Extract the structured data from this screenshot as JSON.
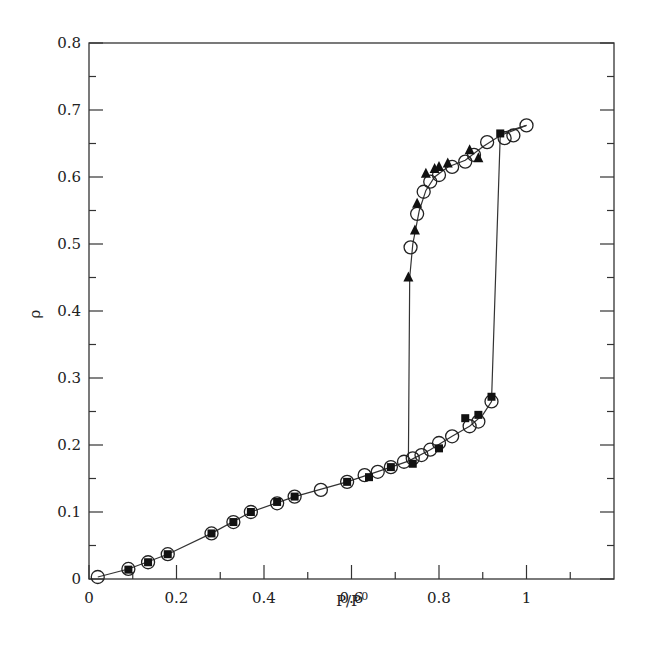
{
  "chart_data": {
    "type": "scatter",
    "title": "",
    "xlabel": "P/P⁰",
    "ylabel": "ρ",
    "xlim": [
      0,
      1.2
    ],
    "ylim": [
      0,
      0.8
    ],
    "grid": false,
    "legend": null,
    "x_ticks": [
      0,
      0.2,
      0.4,
      0.6,
      0.8,
      1
    ],
    "x_tick_labels": [
      "0",
      "0.2",
      "0.4",
      "0.6",
      "0.8",
      "1"
    ],
    "y_ticks": [
      0,
      0.1,
      0.2,
      0.3,
      0.4,
      0.5,
      0.6,
      0.7,
      0.8
    ],
    "y_tick_labels": [
      "0",
      "0.1",
      "0.2",
      "0.3",
      "0.4",
      "0.5",
      "0.6",
      "0.7",
      "0.8"
    ],
    "series": [
      {
        "name": "open-circles",
        "marker": "circle-open",
        "points": [
          [
            0.02,
            0.003
          ],
          [
            0.09,
            0.015
          ],
          [
            0.135,
            0.025
          ],
          [
            0.18,
            0.037
          ],
          [
            0.28,
            0.068
          ],
          [
            0.33,
            0.085
          ],
          [
            0.37,
            0.1
          ],
          [
            0.43,
            0.113
          ],
          [
            0.47,
            0.123
          ],
          [
            0.53,
            0.133
          ],
          [
            0.59,
            0.145
          ],
          [
            0.63,
            0.155
          ],
          [
            0.66,
            0.16
          ],
          [
            0.69,
            0.167
          ],
          [
            0.72,
            0.175
          ],
          [
            0.74,
            0.18
          ],
          [
            0.76,
            0.185
          ],
          [
            0.78,
            0.193
          ],
          [
            0.8,
            0.203
          ],
          [
            0.83,
            0.213
          ],
          [
            0.87,
            0.228
          ],
          [
            0.89,
            0.235
          ],
          [
            0.92,
            0.265
          ],
          [
            0.735,
            0.495
          ],
          [
            0.75,
            0.545
          ],
          [
            0.765,
            0.578
          ],
          [
            0.78,
            0.593
          ],
          [
            0.8,
            0.603
          ],
          [
            0.83,
            0.615
          ],
          [
            0.86,
            0.623
          ],
          [
            0.88,
            0.633
          ],
          [
            0.91,
            0.652
          ],
          [
            0.95,
            0.658
          ],
          [
            0.97,
            0.662
          ],
          [
            1.0,
            0.677
          ]
        ]
      },
      {
        "name": "filled-squares",
        "marker": "square-filled",
        "points": [
          [
            0.09,
            0.014
          ],
          [
            0.135,
            0.025
          ],
          [
            0.18,
            0.037
          ],
          [
            0.28,
            0.068
          ],
          [
            0.33,
            0.085
          ],
          [
            0.37,
            0.1
          ],
          [
            0.43,
            0.115
          ],
          [
            0.47,
            0.123
          ],
          [
            0.59,
            0.145
          ],
          [
            0.64,
            0.152
          ],
          [
            0.69,
            0.167
          ],
          [
            0.74,
            0.172
          ],
          [
            0.8,
            0.195
          ],
          [
            0.86,
            0.24
          ],
          [
            0.89,
            0.245
          ],
          [
            0.92,
            0.272
          ],
          [
            0.94,
            0.665
          ]
        ]
      },
      {
        "name": "filled-triangles",
        "marker": "triangle-filled",
        "points": [
          [
            0.73,
            0.45
          ],
          [
            0.745,
            0.52
          ],
          [
            0.75,
            0.56
          ],
          [
            0.77,
            0.605
          ],
          [
            0.79,
            0.612
          ],
          [
            0.8,
            0.615
          ],
          [
            0.82,
            0.62
          ],
          [
            0.87,
            0.64
          ],
          [
            0.89,
            0.628
          ]
        ]
      }
    ],
    "lines": [
      {
        "name": "adsorption-branch",
        "points": [
          [
            0.02,
            0.003
          ],
          [
            0.09,
            0.015
          ],
          [
            0.18,
            0.037
          ],
          [
            0.28,
            0.068
          ],
          [
            0.37,
            0.1
          ],
          [
            0.47,
            0.123
          ],
          [
            0.59,
            0.145
          ],
          [
            0.69,
            0.167
          ],
          [
            0.73,
            0.176
          ],
          [
            0.78,
            0.193
          ],
          [
            0.83,
            0.213
          ],
          [
            0.87,
            0.228
          ],
          [
            0.9,
            0.245
          ],
          [
            0.92,
            0.265
          ],
          [
            0.94,
            0.665
          ],
          [
            1.0,
            0.677
          ]
        ]
      },
      {
        "name": "desorption-branch",
        "points": [
          [
            1.0,
            0.677
          ],
          [
            0.94,
            0.662
          ],
          [
            0.9,
            0.645
          ],
          [
            0.86,
            0.625
          ],
          [
            0.82,
            0.615
          ],
          [
            0.79,
            0.6
          ],
          [
            0.77,
            0.58
          ],
          [
            0.755,
            0.55
          ],
          [
            0.74,
            0.5
          ],
          [
            0.733,
            0.45
          ],
          [
            0.73,
            0.176
          ]
        ]
      }
    ]
  },
  "axes": {
    "xlabel_main": "P/P",
    "xlabel_sup": "0",
    "ylabel": "ρ"
  }
}
